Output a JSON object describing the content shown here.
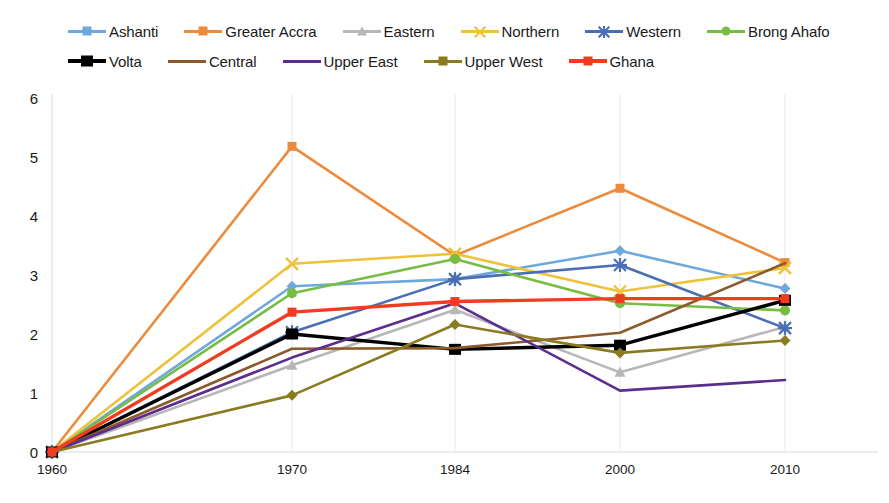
{
  "chart_data": {
    "type": "line",
    "title": "",
    "xlabel": "",
    "ylabel": "",
    "categories": [
      "1960",
      "1970",
      "1984",
      "2000",
      "2010"
    ],
    "ylim": [
      0,
      6
    ],
    "yticks": [
      0,
      1,
      2,
      3,
      4,
      5,
      6
    ],
    "grid": "vertical-only",
    "legend_position": "top",
    "series": [
      {
        "name": "Ashanti",
        "color": "#6FA8DC",
        "marker": "diamond",
        "values": [
          0,
          2.81,
          2.93,
          3.41,
          2.77
        ]
      },
      {
        "name": "Greater Accra",
        "color": "#ED8B3C",
        "marker": "square",
        "values": [
          0,
          5.18,
          3.33,
          4.47,
          3.21
        ]
      },
      {
        "name": "Eastern",
        "color": "#B7B7B7",
        "marker": "triangle",
        "values": [
          0,
          1.47,
          2.41,
          1.35,
          2.12
        ]
      },
      {
        "name": "Northern",
        "color": "#EFC23C",
        "marker": "x",
        "values": [
          0,
          3.19,
          3.36,
          2.72,
          3.12
        ]
      },
      {
        "name": "Western",
        "color": "#4A6FB5",
        "marker": "star",
        "values": [
          0,
          2.03,
          2.93,
          3.17,
          2.1
        ]
      },
      {
        "name": "Brong Ahafo",
        "color": "#77BC43",
        "marker": "circle",
        "values": [
          0,
          2.69,
          3.27,
          2.52,
          2.4
        ]
      },
      {
        "name": "Volta",
        "color": "#000000",
        "marker": "square-big",
        "values": [
          0,
          2.0,
          1.74,
          1.81,
          2.57
        ]
      },
      {
        "name": "Central",
        "color": "#8C5A2B",
        "marker": "line",
        "values": [
          0,
          1.75,
          1.76,
          2.02,
          3.2
        ]
      },
      {
        "name": "Upper East",
        "color": "#5B2D8E",
        "marker": "line",
        "values": [
          0,
          1.6,
          2.52,
          1.04,
          1.22
        ]
      },
      {
        "name": "Upper West",
        "color": "#8A7B20",
        "marker": "diamond",
        "values": [
          0,
          0.96,
          2.16,
          1.68,
          1.89
        ]
      },
      {
        "name": "Ghana",
        "color": "#F03C21",
        "marker": "square",
        "values": [
          0,
          2.37,
          2.55,
          2.6,
          2.6
        ]
      }
    ]
  },
  "legend": {
    "rows": [
      [
        "Ashanti",
        "Greater Accra",
        "Eastern",
        "Northern",
        "Western",
        "Brong Ahafo"
      ],
      [
        "Volta",
        "Central",
        "Upper East",
        "Upper West",
        "Ghana"
      ]
    ]
  }
}
